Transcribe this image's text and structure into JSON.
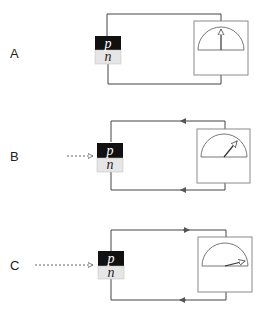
{
  "panels": [
    {
      "label": "A",
      "p_label": "p",
      "n_label": "n",
      "light": "none",
      "current": "none",
      "needle": "zero"
    },
    {
      "label": "B",
      "p_label": "p",
      "n_label": "n",
      "light": "short-dashed-arrow",
      "current": "small",
      "needle": "moderate"
    },
    {
      "label": "C",
      "p_label": "p",
      "n_label": "n",
      "light": "long-dashed-arrow",
      "current": "large",
      "needle": "large"
    }
  ],
  "colors": {
    "line": "#444444",
    "p_region": "#111111",
    "n_region": "#e6e6e6",
    "box": "#8a8a8a"
  }
}
